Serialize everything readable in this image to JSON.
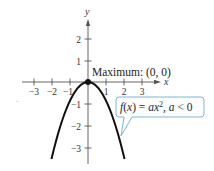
{
  "chart_data": {
    "type": "line",
    "title": "",
    "xlabel": "x",
    "ylabel": "y",
    "xlim": [
      -3.3,
      4.0
    ],
    "ylim": [
      -3.6,
      2.8
    ],
    "x_ticks": [
      -3,
      -2,
      -1,
      1,
      2,
      3
    ],
    "x_tick_labels": [
      "−3",
      "−2",
      "−1",
      "1",
      "2",
      "3"
    ],
    "y_ticks": [
      2,
      1,
      -1,
      -2,
      -3
    ],
    "y_tick_labels": [
      "2",
      "1",
      "−1",
      "−2",
      "−3"
    ],
    "grid": false,
    "series": [
      {
        "name": "f(x) = ax², a < 0",
        "function": "a*x^2",
        "a": -0.85,
        "x": [
          -2.0,
          -1.5,
          -1.0,
          -0.5,
          0,
          0.5,
          1.0,
          1.5,
          2.0
        ],
        "y": [
          -3.4,
          -1.91,
          -0.85,
          -0.21,
          0,
          -0.21,
          -0.85,
          -1.91,
          -3.4
        ]
      }
    ],
    "points": [
      {
        "x": 0,
        "y": 0,
        "label": "Maximum: (0, 0)"
      }
    ],
    "annotations": [
      {
        "text": "Maximum: (0, 0)",
        "anchor": [
          0,
          0
        ]
      },
      {
        "text": "f(x) = ax², a < 0",
        "type": "callout",
        "points_to": "curve-right-branch"
      }
    ]
  },
  "labels": {
    "x_axis": "x",
    "y_axis": "y",
    "maximum": "Maximum: (0, 0)",
    "callout_f": "f",
    "callout_paren_open": "(",
    "callout_x": "x",
    "callout_mid": ") = ",
    "callout_ax": "ax",
    "callout_exp": "2",
    "callout_comma": ", ",
    "callout_a": "a",
    "callout_tail": " < 0"
  },
  "colors": {
    "curve": "#111111",
    "axis": "#555555",
    "callout_border": "#7fb6d8",
    "callout_fill": "#fbfdff"
  }
}
